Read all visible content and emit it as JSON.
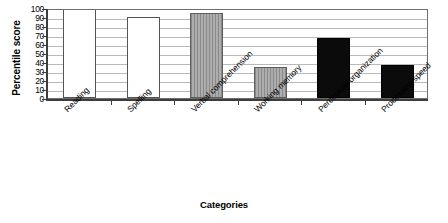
{
  "chart_data": {
    "type": "bar",
    "title": "",
    "xlabel": "Categories",
    "ylabel": "Percentile score",
    "categories": [
      "Reading",
      "Spelling",
      "Verbal comprehension",
      "Working memory",
      "Perceptual organization",
      "Processing speed"
    ],
    "values": [
      99,
      90,
      94,
      35,
      67,
      37
    ],
    "ylim": [
      0,
      100
    ],
    "yticks": [
      0,
      10,
      20,
      30,
      40,
      50,
      60,
      70,
      80,
      90,
      100
    ],
    "ytick_labels": [
      "0",
      "10",
      "20",
      "30",
      "40",
      "50",
      "60",
      "70",
      "80",
      "90",
      "100"
    ],
    "grid": true,
    "legend": "none",
    "bar_patterns": [
      "dot-light",
      "blank",
      "vertical-stripe",
      "vertical-stripe",
      "dot-dark",
      "dot-dark"
    ],
    "colors": {
      "axis": "#3d3d3d",
      "grid": "#b9b9b9",
      "frame": "#6e6e6e",
      "bar_light": "#ffffff",
      "bar_gray": "#9a9a9a",
      "bar_dark": "#0b0b0b",
      "text": "#000000",
      "background": "#ffffff"
    }
  }
}
